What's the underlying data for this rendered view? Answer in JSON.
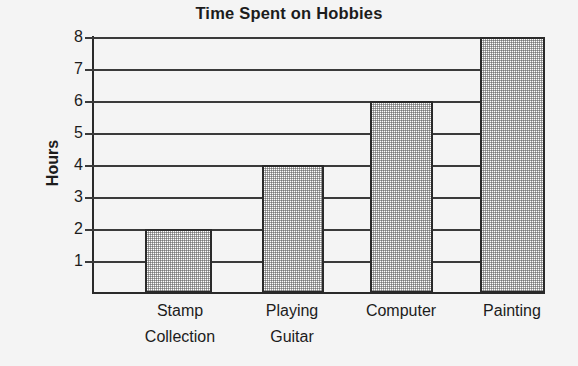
{
  "chart_data": {
    "type": "bar",
    "title": "Time Spent on Hobbies",
    "xlabel": "",
    "ylabel": "Hours",
    "categories": [
      "Stamp Collection",
      "Playing Guitar",
      "Computer",
      "Painting"
    ],
    "category_lines": [
      [
        "Stamp",
        "Collection"
      ],
      [
        "Playing",
        "Guitar"
      ],
      [
        "Computer",
        ""
      ],
      [
        "Painting",
        ""
      ]
    ],
    "values": [
      2,
      4,
      6,
      8
    ],
    "ylim": [
      0,
      8
    ],
    "ytick_labels": [
      "8",
      "7",
      "6",
      "5",
      "4",
      "3",
      "2",
      "1"
    ],
    "ytick_values": [
      8,
      7,
      6,
      5,
      4,
      3,
      2,
      1
    ],
    "grid": true,
    "legend": "none",
    "colors": {
      "background": "#f4f4f4",
      "axis": "#2a2a2a",
      "grid": "#3a3a3a",
      "text": "#1c1c1c",
      "bar_fill": "#ffffff",
      "bar_pattern": "#5a5a5a",
      "bar_edge": "#2a2a2a"
    }
  }
}
